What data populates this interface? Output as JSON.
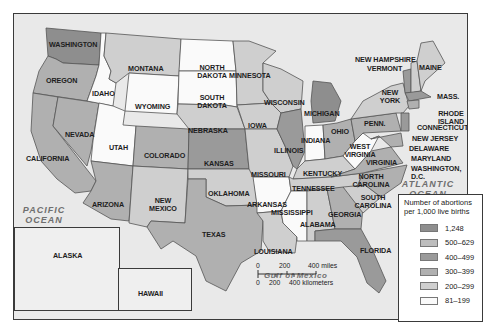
{
  "map": {
    "title_hidden": "",
    "colors": {
      "c1248": "#8e8e8e",
      "c500_629": "#bdbdbd",
      "c400_499": "#9a9a9a",
      "c300_399": "#b0b0b0",
      "c200_299": "#cfcfcf",
      "c81_199": "#fafafa",
      "water": "#e9e9e9",
      "border": "#555555"
    },
    "states": {
      "washington": "WASHINGTON",
      "oregon": "OREGON",
      "california": "CALIFORNIA",
      "nevada": "NEVADA",
      "idaho": "IDAHO",
      "montana": "MONTANA",
      "wyoming": "WYOMING",
      "utah": "UTAH",
      "colorado": "COLORADO",
      "arizona": "ARIZONA",
      "new_mexico": "NEW MEXICO",
      "north_dakota": "NORTH DAKOTA",
      "south_dakota": "SOUTH DAKOTA",
      "nebraska": "NEBRASKA",
      "kansas": "KANSAS",
      "oklahoma": "OKLAHOMA",
      "texas": "TEXAS",
      "minnesota": "MINNESOTA",
      "iowa": "IOWA",
      "missouri": "MISSOURI",
      "arkansas": "ARKANSAS",
      "louisiana": "LOUISIANA",
      "wisconsin": "WISCONSIN",
      "illinois": "ILLINOIS",
      "michigan": "MICHIGAN",
      "indiana": "INDIANA",
      "ohio": "OHIO",
      "kentucky": "KENTUCKY",
      "tennessee": "TENNESSEE",
      "mississippi": "MISSISSIPPI",
      "alabama": "ALABAMA",
      "georgia": "GEORGIA",
      "florida": "FLORIDA",
      "south_carolina": "SOUTH CAROLINA",
      "north_carolina": "NORTH CAROLINA",
      "virginia": "VIRGINIA",
      "west_virginia": "WEST VIRGINIA",
      "penn": "PENN.",
      "new_york": "NEW YORK",
      "vermont": "VERMONT",
      "new_hampshire": "NEW HAMPSHIRE",
      "maine": "MAINE",
      "mass": "MASS.",
      "rhode_island": "RHODE ISLAND",
      "connecticut": "CONNECTICUT",
      "new_jersey": "NEW JERSEY",
      "delaware": "DELAWARE",
      "maryland": "MARYLAND",
      "washington_dc": "WASHINGTON, D.C.",
      "alaska": "ALASKA",
      "hawaii": "HAWAII"
    },
    "water_labels": {
      "pacific": "PACIFIC OCEAN",
      "atlantic": "ATLANTIC OCEAN",
      "gulf": "Gulf of Mexico"
    },
    "legend": {
      "title": "Number of abortions per 1,000 live births",
      "items": [
        {
          "label": "1,248",
          "color": "#8e8e8e"
        },
        {
          "label": "500–629",
          "color": "#bdbdbd"
        },
        {
          "label": "400–499",
          "color": "#9a9a9a"
        },
        {
          "label": "300–399",
          "color": "#b0b0b0"
        },
        {
          "label": "200–299",
          "color": "#cfcfcf"
        },
        {
          "label": "81–199",
          "color": "#fafafa"
        }
      ]
    },
    "scale": {
      "miles": [
        "0",
        "200",
        "400 miles"
      ],
      "km": [
        "0",
        "200",
        "400 kilometers"
      ]
    }
  }
}
